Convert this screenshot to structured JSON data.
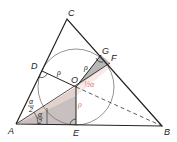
{
  "diagram": {
    "type": "geometry-incircle-triangle",
    "points": {
      "A": {
        "label": "A"
      },
      "B": {
        "label": "B"
      },
      "C": {
        "label": "C"
      },
      "D": {
        "label": "D"
      },
      "E": {
        "label": "E"
      },
      "F": {
        "label": "F"
      },
      "G": {
        "label": "G"
      },
      "O": {
        "label": "O"
      }
    },
    "labels": {
      "rho_OD": "ρ",
      "rho_OG": "ρ",
      "rho_OE": "ρ",
      "alpha_top": "α",
      "alpha_top_den": "2",
      "alpha_bot": "α",
      "alpha_bot_den": "2",
      "angle_GOF": "½α"
    },
    "colors": {
      "line": "#222222",
      "circle": "#666666",
      "shade": "#b5b5b5",
      "pink": "#f2d6d2",
      "red_text": "#e0736a"
    }
  }
}
